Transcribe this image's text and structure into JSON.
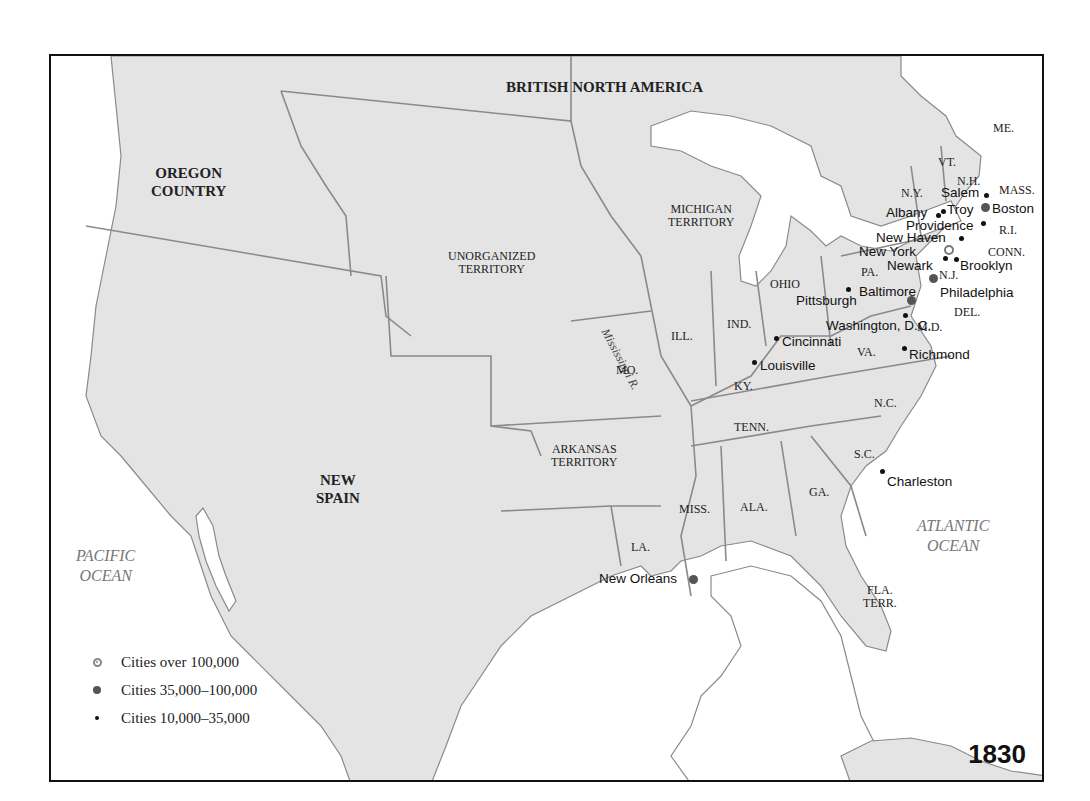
{
  "map": {
    "year": "1830",
    "regions": {
      "british_north_america": "BRITISH NORTH AMERICA",
      "oregon_country": [
        "OREGON",
        "COUNTRY"
      ],
      "new_spain": [
        "NEW",
        "SPAIN"
      ],
      "unorganized_territory": [
        "UNORGANIZED",
        "TERRITORY"
      ],
      "michigan_territory": [
        "MICHIGAN",
        "TERRITORY"
      ],
      "arkansas_territory": [
        "ARKANSAS",
        "TERRITORY"
      ],
      "florida_territory": [
        "FLA.",
        "TERR."
      ]
    },
    "oceans": {
      "pacific": [
        "PACIFIC",
        "OCEAN"
      ],
      "atlantic": [
        "ATLANTIC",
        "OCEAN"
      ]
    },
    "river": "Mississippi R.",
    "states": {
      "me": "ME.",
      "vt": "VT.",
      "nh": "N.H.",
      "mass": "MASS.",
      "ny": "N.Y.",
      "ri": "R.I.",
      "conn": "CONN.",
      "nj": "N.J.",
      "pa": "PA.",
      "del": "DEL.",
      "md": "M.D.",
      "ohio": "OHIO",
      "ind": "IND.",
      "ill": "ILL.",
      "mo": "MO.",
      "ky": "KY.",
      "va": "VA.",
      "nc": "N.C.",
      "tenn": "TENN.",
      "sc": "S.C.",
      "ga": "GA.",
      "ala": "ALA.",
      "miss": "MISS.",
      "la": "LA."
    },
    "cities": {
      "salem": "Salem",
      "boston": "Boston",
      "albany": "Albany",
      "troy": "Troy",
      "providence": "Providence",
      "new_haven": "New Haven",
      "new_york": "New York",
      "newark": "Newark",
      "brooklyn": "Brooklyn",
      "pittsburgh": "Pittsburgh",
      "baltimore": "Baltimore",
      "philadelphia": "Philadelphia",
      "washington": "Washington, D.C.",
      "cincinnati": "Cincinnati",
      "louisville": "Louisville",
      "richmond": "Richmond",
      "charleston": "Charleston",
      "new_orleans": "New Orleans"
    },
    "legend": [
      {
        "symbol": "cities-over-100000-icon",
        "label": "Cities over 100,000"
      },
      {
        "symbol": "cities-35000-100000-icon",
        "label": "Cities 35,000–100,000"
      },
      {
        "symbol": "cities-10000-35000-icon",
        "label": "Cities 10,000–35,000"
      }
    ],
    "colors": {
      "land": "#e4e4e4",
      "water": "#ffffff",
      "border": "#8a8a8a",
      "frame": "#111111"
    }
  }
}
